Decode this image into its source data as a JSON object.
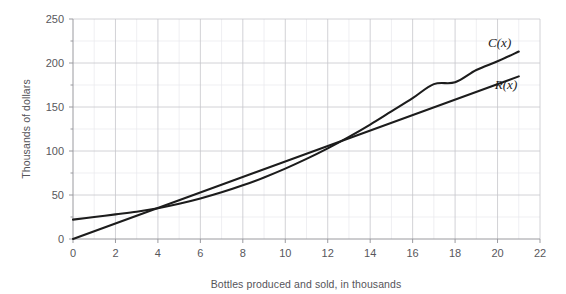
{
  "chart_data": {
    "type": "line",
    "title": "",
    "xlabel": "Bottles produced and sold, in thousands",
    "ylabel": "Thousands of dollars",
    "xlim": [
      0,
      22
    ],
    "ylim": [
      0,
      250
    ],
    "xticks": [
      0,
      2,
      4,
      6,
      8,
      10,
      12,
      14,
      16,
      18,
      20,
      22
    ],
    "yticks": [
      0,
      50,
      100,
      150,
      200,
      250
    ],
    "xtick_labels": [
      "0",
      "2",
      "4",
      "6",
      "8",
      "10",
      "12",
      "14",
      "16",
      "18",
      "20",
      "22"
    ],
    "ytick_labels": [
      "0",
      "50",
      "100",
      "150",
      "200",
      "250"
    ],
    "x_minor_step": 1,
    "y_minor_step": 25,
    "grid": true,
    "legend": "inline-end-labels",
    "annotations": [
      {
        "text": "C(x)",
        "x": 20.1,
        "y": 218
      },
      {
        "text": "R(x)",
        "x": 20.4,
        "y": 170
      }
    ],
    "series": [
      {
        "name": "C(x)",
        "label": "C(x)",
        "color": "#1c1c1c",
        "shape": "curved",
        "x": [
          0,
          1,
          2,
          3,
          4,
          5,
          6,
          7,
          8,
          9,
          10,
          11,
          12,
          13,
          14,
          15,
          16,
          17,
          18,
          19,
          20,
          21
        ],
        "values": [
          22,
          25,
          28,
          31,
          35,
          40,
          46,
          53,
          61,
          70,
          80,
          91,
          103,
          116,
          130,
          145,
          160,
          176,
          178,
          192,
          202,
          213
        ]
      },
      {
        "name": "R(x)",
        "label": "R(x)",
        "color": "#1c1c1c",
        "shape": "straight",
        "x": [
          0,
          1,
          2,
          3,
          4,
          5,
          6,
          7,
          8,
          9,
          10,
          11,
          12,
          13,
          14,
          15,
          16,
          17,
          18,
          19,
          20,
          21
        ],
        "values": [
          0,
          8.8,
          17.6,
          26.4,
          35.2,
          44,
          52.8,
          61.6,
          70.4,
          79.2,
          88,
          96.8,
          105.6,
          114.4,
          123.2,
          132,
          140.8,
          149.6,
          158.4,
          167.2,
          176,
          184.8
        ]
      }
    ],
    "intersections": [
      {
        "x": 3,
        "y": 26
      },
      {
        "x": 18,
        "y": 160
      }
    ]
  },
  "layout": {
    "plot_left": 73,
    "plot_right": 540,
    "plot_top": 19,
    "plot_bottom": 239
  }
}
